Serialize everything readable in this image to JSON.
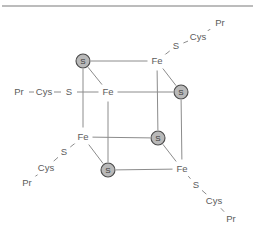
{
  "figure": {
    "kind": "chemical-structure-diagram",
    "colors": {
      "bond": "#8c8c8c",
      "sulfur_fill": "#b9b9b9",
      "sulfur_stroke": "#4a4a4a",
      "label_text": "#5b5b5b",
      "rule": "#7a7a7a",
      "background": "#ffffff"
    },
    "top_rule": true,
    "core_atoms": [
      {
        "id": "s-back-top-left",
        "label": "S",
        "x": 83,
        "y": 61,
        "kind": "sulfide"
      },
      {
        "id": "fe-back-top-right",
        "label": "Fe",
        "x": 157,
        "y": 61,
        "kind": "iron"
      },
      {
        "id": "fe-front-top-left",
        "label": "Fe",
        "x": 108,
        "y": 92,
        "kind": "iron"
      },
      {
        "id": "s-front-top-right",
        "label": "S",
        "x": 181,
        "y": 92,
        "kind": "sulfide"
      },
      {
        "id": "fe-back-bot-left",
        "label": "Fe",
        "x": 83,
        "y": 137,
        "kind": "iron"
      },
      {
        "id": "s-back-bot-right",
        "label": "S",
        "x": 158,
        "y": 138,
        "kind": "sulfide"
      },
      {
        "id": "s-front-bot-left",
        "label": "S",
        "x": 108,
        "y": 170,
        "kind": "sulfide"
      },
      {
        "id": "fe-front-bot-right",
        "label": "Fe",
        "x": 182,
        "y": 169,
        "kind": "iron"
      }
    ],
    "ligands": [
      {
        "id": "ligand-left",
        "attached_to": "fe-front-top-left",
        "atoms": [
          {
            "label": "S",
            "x": 69,
            "y": 92
          },
          {
            "label": "Cys",
            "x": 44,
            "y": 92
          },
          {
            "label": "Pr",
            "x": 19,
            "y": 92
          }
        ]
      },
      {
        "id": "ligand-top-right",
        "attached_to": "fe-back-top-right",
        "atoms": [
          {
            "label": "S",
            "x": 176,
            "y": 46
          },
          {
            "label": "Cys",
            "x": 198,
            "y": 37
          },
          {
            "label": "Pr",
            "x": 220,
            "y": 23
          }
        ]
      },
      {
        "id": "ligand-bottom-left",
        "attached_to": "fe-back-bot-left",
        "atoms": [
          {
            "label": "S",
            "x": 64,
            "y": 152
          },
          {
            "label": "Cys",
            "x": 46,
            "y": 168
          },
          {
            "label": "Pr",
            "x": 27,
            "y": 183
          }
        ]
      },
      {
        "id": "ligand-bottom-right",
        "attached_to": "fe-front-bot-right",
        "atoms": [
          {
            "label": "S",
            "x": 196,
            "y": 185
          },
          {
            "label": "Cys",
            "x": 214,
            "y": 201
          },
          {
            "label": "Pr",
            "x": 231,
            "y": 219
          }
        ]
      }
    ],
    "labels": {
      "iron": "Fe",
      "sulfide": "S",
      "thiolate_sulfur": "S",
      "cysteine": "Cys",
      "protein": "Pr"
    }
  }
}
